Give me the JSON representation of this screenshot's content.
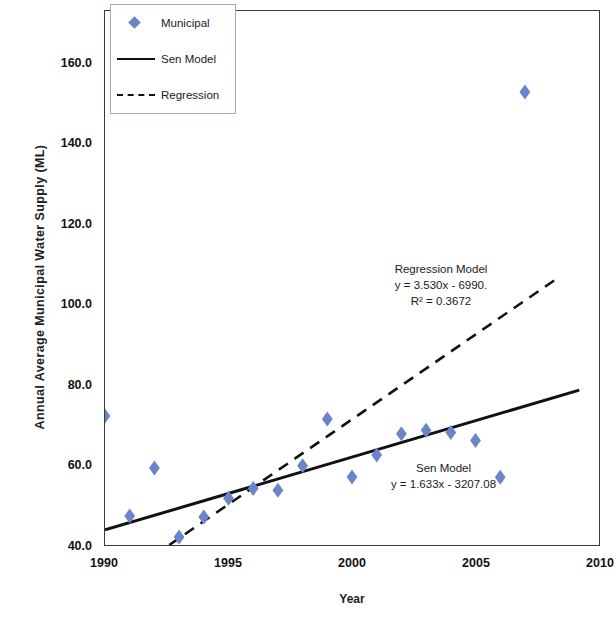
{
  "chart_data": {
    "type": "scatter",
    "title": "",
    "xlabel": "Year",
    "ylabel": "Annual Average Municipal Water Supply (ML)",
    "xlim": [
      1990,
      2010
    ],
    "ylim": [
      40.0,
      160.0
    ],
    "xticks": [
      "1990",
      "1995",
      "2000",
      "2005",
      "2010"
    ],
    "yticks": [
      "40.0",
      "60.0",
      "80.0",
      "100.0",
      "120.0",
      "140.0",
      "160.0"
    ],
    "grid": false,
    "legend_position": "top-left",
    "marker_color": "#6b84cc",
    "line_color": "#111111",
    "series": [
      {
        "name": "Municipal",
        "type": "scatter",
        "x": [
          1990,
          1991,
          1992,
          1993,
          1994,
          1995,
          1996,
          1997,
          1998,
          1999,
          2000,
          2001,
          2002,
          2003,
          2004,
          2005,
          2006,
          2007,
          2008
        ],
        "values": [
          69.0,
          46.5,
          57.3,
          41.8,
          46.3,
          50.5,
          52.7,
          52.3,
          57.8,
          68.3,
          55.3,
          60.2,
          65.0,
          65.8,
          65.3,
          63.5,
          55.2,
          141.8,
          172.0
        ]
      },
      {
        "name": "Sen Model",
        "type": "line",
        "style": "solid",
        "x": [
          1990,
          2009.2
        ],
        "values": [
          43.4,
          74.8
        ]
      },
      {
        "name": "Regression",
        "type": "line",
        "style": "dashed",
        "x": [
          1992.6,
          2008.2
        ],
        "values": [
          40.0,
          99.5
        ]
      }
    ],
    "annotations": [
      {
        "name": "regression-model",
        "lines": [
          "Regression Model",
          "y = 3.530x - 6990.",
          "R² = 0.3672"
        ]
      },
      {
        "name": "sen-model",
        "lines": [
          "Sen Model",
          "y = 1.633x - 3207.08"
        ]
      }
    ]
  },
  "legend": {
    "items": [
      {
        "label": "Municipal",
        "key": "diamond-marker-icon"
      },
      {
        "label": "Sen Model",
        "key": "solid-line-icon"
      },
      {
        "label": "Regression",
        "key": "dashed-line-icon"
      }
    ]
  },
  "axes": {
    "y_title": "Annual Average Municipal Water Supply (ML)",
    "x_title": "Year"
  },
  "annotations": {
    "regression": {
      "line1": "Regression Model",
      "line2": "y = 3.530x - 6990.",
      "line3": "R² = 0.3672"
    },
    "sen": {
      "line1": "Sen Model",
      "line2": "y = 1.633x - 3207.08"
    }
  }
}
